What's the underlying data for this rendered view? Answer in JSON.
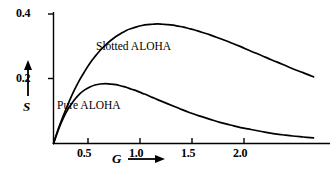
{
  "chart_data": {
    "type": "line",
    "title": "",
    "subtitle": "",
    "xlabel": "G",
    "ylabel": "S",
    "xlim": [
      0,
      2.55
    ],
    "ylim": [
      0,
      0.44
    ],
    "grid": false,
    "legend_position": "inline-annotations",
    "x_ticks": [
      "0.5",
      "1.0",
      "1.5",
      "2.0"
    ],
    "x_tick_values": [
      0.5,
      1.0,
      1.5,
      2.0
    ],
    "y_ticks": [
      "0.2",
      "0.4"
    ],
    "y_tick_values": [
      0.2,
      0.4
    ],
    "x_axis_arrow": "right-arrow",
    "y_axis_arrow": "up-arrow",
    "series": [
      {
        "name": "Slotted ALOHA",
        "formula": "S = G*exp(-G)",
        "peak_x": 1.0,
        "peak_y": 0.368,
        "x": [
          0.0,
          0.05,
          0.1,
          0.15,
          0.2,
          0.25,
          0.3,
          0.35,
          0.4,
          0.45,
          0.5,
          0.55,
          0.6,
          0.65,
          0.7,
          0.75,
          0.8,
          0.85,
          0.9,
          0.95,
          1.0,
          1.05,
          1.1,
          1.15,
          1.2,
          1.25,
          1.3,
          1.35,
          1.4,
          1.45,
          1.5,
          1.6,
          1.7,
          1.8,
          1.9,
          2.0,
          2.1,
          2.2,
          2.3,
          2.4,
          2.5
        ],
        "values": [
          0.0,
          0.048,
          0.09,
          0.129,
          0.164,
          0.195,
          0.222,
          0.247,
          0.268,
          0.287,
          0.303,
          0.317,
          0.329,
          0.339,
          0.348,
          0.354,
          0.359,
          0.363,
          0.366,
          0.367,
          0.368,
          0.367,
          0.366,
          0.364,
          0.361,
          0.358,
          0.354,
          0.35,
          0.345,
          0.34,
          0.335,
          0.323,
          0.311,
          0.298,
          0.284,
          0.271,
          0.257,
          0.244,
          0.23,
          0.218,
          0.205
        ]
      },
      {
        "name": "Pure ALOHA",
        "formula": "S = G*exp(-2G)",
        "peak_x": 0.5,
        "peak_y": 0.184,
        "x": [
          0.0,
          0.05,
          0.1,
          0.15,
          0.2,
          0.25,
          0.3,
          0.35,
          0.4,
          0.45,
          0.5,
          0.55,
          0.6,
          0.65,
          0.7,
          0.75,
          0.8,
          0.85,
          0.9,
          0.95,
          1.0,
          1.1,
          1.2,
          1.3,
          1.4,
          1.5,
          1.6,
          1.7,
          1.8,
          1.9,
          2.0,
          2.1,
          2.2,
          2.3,
          2.4,
          2.5
        ],
        "values": [
          0.0,
          0.045,
          0.082,
          0.111,
          0.134,
          0.152,
          0.165,
          0.174,
          0.18,
          0.183,
          0.184,
          0.183,
          0.181,
          0.177,
          0.173,
          0.167,
          0.162,
          0.155,
          0.149,
          0.142,
          0.135,
          0.122,
          0.109,
          0.096,
          0.085,
          0.075,
          0.065,
          0.057,
          0.049,
          0.043,
          0.037,
          0.031,
          0.027,
          0.023,
          0.02,
          0.017
        ]
      }
    ],
    "annotations": [
      {
        "text": "Slotted ALOHA",
        "x": 0.73,
        "y": 0.29
      },
      {
        "text": "Pure ALOHA",
        "x": 0.17,
        "y": 0.115
      }
    ],
    "colors": {
      "axis": "#000000",
      "curve": "#000000",
      "background": "#ffffff",
      "text": "#000000"
    }
  },
  "axes": {
    "y_title": "S",
    "x_title": "G",
    "y_tick_0": "0.2",
    "y_tick_1": "0.4",
    "x_tick_0": "0.5",
    "x_tick_1": "1.0",
    "x_tick_2": "1.5",
    "x_tick_3": "2.0"
  },
  "labels": {
    "slotted": "Slotted ALOHA",
    "pure": "Pure ALOHA"
  }
}
